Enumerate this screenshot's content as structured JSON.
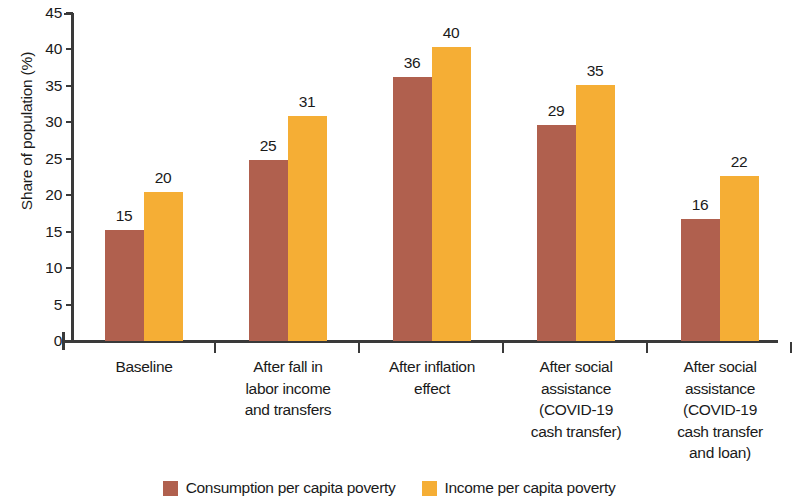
{
  "chart_data": {
    "type": "bar",
    "title": "",
    "xlabel": "",
    "ylabel": "Share of population (%)",
    "ylim": [
      0,
      45
    ],
    "y_ticks": [
      0,
      5,
      10,
      15,
      20,
      25,
      30,
      35,
      40,
      45
    ],
    "grid": false,
    "legend_position": "bottom",
    "categories": [
      "Baseline",
      "After fall in labor income and transfers",
      "After inflation effect",
      "After social assistance (COVID-19 cash transfer)",
      "After social assistance (COVID-19 cash transfer and loan)"
    ],
    "category_lines": [
      [
        "Baseline"
      ],
      [
        "After fall in",
        "labor income",
        "and transfers"
      ],
      [
        "After inflation",
        "effect"
      ],
      [
        "After social",
        "assistance",
        "(COVID-19",
        "cash transfer)"
      ],
      [
        "After social",
        "assistance",
        "(COVID-19",
        "cash transfer",
        "and loan)"
      ]
    ],
    "series": [
      {
        "name": "Consumption per capita poverty",
        "color": "#b0604e",
        "values": [
          15,
          25,
          36,
          29,
          16
        ],
        "bar_tops": [
          15.2,
          24.8,
          36.2,
          29.7,
          16.7
        ]
      },
      {
        "name": "Income per capita poverty",
        "color": "#f5ae35",
        "values": [
          20,
          31,
          40,
          35,
          22
        ],
        "bar_tops": [
          20.5,
          30.9,
          40.3,
          35.1,
          22.6
        ]
      }
    ]
  },
  "legend": {
    "items": [
      {
        "label": "Consumption per capita poverty",
        "color": "#b0604e"
      },
      {
        "label": "Income per capita poverty",
        "color": "#f5ae35"
      }
    ]
  },
  "axis": {
    "y_title": "Share of population (%)"
  }
}
